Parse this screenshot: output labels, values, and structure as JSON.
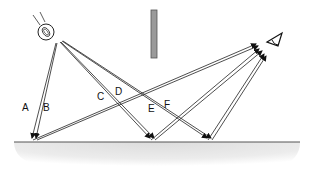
{
  "diagram": {
    "type": "optics-ray-diagram",
    "elements": {
      "light_source": {
        "cx": 46,
        "cy": 32,
        "r": 9,
        "icon": "lightbulb-icon"
      },
      "occluder": {
        "x": 151,
        "y": 10,
        "width": 6,
        "height": 48,
        "color": "#888888"
      },
      "eye": {
        "x": 272,
        "y": 38,
        "icon": "eye-icon"
      },
      "ground": {
        "y": 142,
        "x1": 14,
        "x2": 300,
        "fill": "#e4e4e4",
        "line": "#555555"
      }
    },
    "labels": [
      {
        "id": "A",
        "text": "A",
        "x": 22,
        "y": 103
      },
      {
        "id": "B",
        "text": "B",
        "x": 43,
        "y": 103
      },
      {
        "id": "C",
        "text": "C",
        "x": 97,
        "y": 92
      },
      {
        "id": "D",
        "text": "D",
        "x": 115,
        "y": 87
      },
      {
        "id": "E",
        "text": "E",
        "x": 148,
        "y": 104
      },
      {
        "id": "F",
        "text": "F",
        "x": 164,
        "y": 100
      }
    ],
    "rays": [
      {
        "name": "ray-A-in",
        "from": [
          56,
          43
        ],
        "to": [
          32,
          138
        ]
      },
      {
        "name": "ray-B-in",
        "from": [
          57,
          43
        ],
        "to": [
          36,
          138
        ]
      },
      {
        "name": "ray-AB-out-1",
        "from": [
          33,
          140
        ],
        "to": [
          256,
          44
        ]
      },
      {
        "name": "ray-AB-out-2",
        "from": [
          37,
          140
        ],
        "to": [
          258,
          46
        ]
      },
      {
        "name": "ray-C-in",
        "from": [
          60,
          42
        ],
        "to": [
          150,
          138
        ]
      },
      {
        "name": "ray-D-in",
        "from": [
          61,
          42
        ],
        "to": [
          154,
          138
        ]
      },
      {
        "name": "ray-CD-out-1",
        "from": [
          151,
          140
        ],
        "to": [
          259,
          49
        ]
      },
      {
        "name": "ray-CD-out-2",
        "from": [
          155,
          140
        ],
        "to": [
          262,
          51
        ]
      },
      {
        "name": "ray-E-in",
        "from": [
          62,
          41
        ],
        "to": [
          207,
          138
        ]
      },
      {
        "name": "ray-F-in",
        "from": [
          63,
          41
        ],
        "to": [
          211,
          138
        ]
      },
      {
        "name": "ray-EF-out-1",
        "from": [
          208,
          140
        ],
        "to": [
          264,
          54
        ]
      },
      {
        "name": "ray-EF-out-2",
        "from": [
          212,
          140
        ],
        "to": [
          266,
          56
        ]
      }
    ]
  }
}
